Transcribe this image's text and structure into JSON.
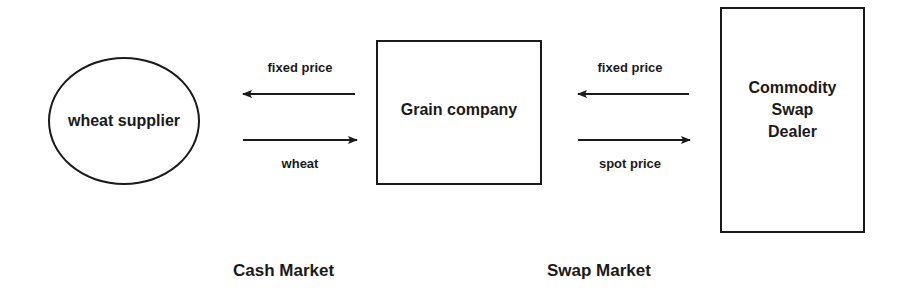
{
  "nodes": {
    "supplier": {
      "label": "wheat supplier"
    },
    "grain_company": {
      "label": "Grain company"
    },
    "dealer": {
      "lines": [
        "Commodity",
        "Swap",
        "Dealer"
      ]
    }
  },
  "edges": {
    "cash_top": {
      "label": "fixed price",
      "direction": "left",
      "from": "Grain company",
      "to": "wheat supplier"
    },
    "cash_bottom": {
      "label": "wheat",
      "direction": "right",
      "from": "wheat supplier",
      "to": "Grain company"
    },
    "swap_top": {
      "label": "fixed price",
      "direction": "left",
      "from": "Commodity Swap Dealer",
      "to": "Grain company"
    },
    "swap_bottom": {
      "label": "spot price",
      "direction": "right",
      "from": "Grain company",
      "to": "Commodity Swap Dealer"
    }
  },
  "sections": {
    "cash_market": "Cash Market",
    "swap_market": "Swap Market"
  },
  "colors": {
    "stroke": "#1a1a1a",
    "background": "#ffffff"
  }
}
